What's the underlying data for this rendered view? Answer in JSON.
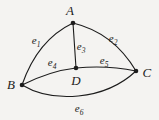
{
  "figure": {
    "background_color": "#f4f3f1",
    "ink_color": "#1c1c1c",
    "width": 159,
    "height": 120
  },
  "chart_data": {
    "type": "diagram",
    "subtype": "graph",
    "title": "",
    "vertices": [
      {
        "id": "A",
        "label": "A",
        "x": 73,
        "y": 23,
        "label_x": 70,
        "label_y": 10
      },
      {
        "id": "B",
        "label": "B",
        "x": 22,
        "y": 85,
        "label_x": 11,
        "label_y": 84
      },
      {
        "id": "C",
        "label": "C",
        "x": 136,
        "y": 71,
        "label_x": 147,
        "label_y": 72
      },
      {
        "id": "D",
        "label": "D",
        "x": 76,
        "y": 68,
        "label_x": 76,
        "label_y": 80
      }
    ],
    "edges": [
      {
        "id": "e1",
        "name": "e",
        "subscript": "1",
        "from": "A",
        "to": "B",
        "path": "M 73 23 C 52 33 33 53 22 85",
        "label_x": 36,
        "label_y": 40
      },
      {
        "id": "e2",
        "name": "e",
        "subscript": "2",
        "from": "A",
        "to": "C",
        "path": "M 73 23 C 98 29 120 44 136 71",
        "label_x": 113,
        "label_y": 38
      },
      {
        "id": "e3",
        "name": "e",
        "subscript": "3",
        "from": "A",
        "to": "D",
        "path": "M 73 23 L 76 68",
        "label_x": 81,
        "label_y": 46
      },
      {
        "id": "e4",
        "name": "e",
        "subscript": "4",
        "from": "B",
        "to": "D",
        "path": "M 22 85 C 40 76 58 70 76 68",
        "label_x": 52,
        "label_y": 62
      },
      {
        "id": "e5",
        "name": "e",
        "subscript": "5",
        "from": "D",
        "to": "C",
        "path": "M 76 68 C 96 66 117 67 136 71",
        "label_x": 104,
        "label_y": 60
      },
      {
        "id": "e6",
        "name": "e",
        "subscript": "6",
        "from": "B",
        "to": "C",
        "path": "M 22 85 C 52 103 104 101 136 71",
        "label_x": 79,
        "label_y": 108
      }
    ],
    "vertex_count": 4,
    "edge_count": 6,
    "legend": [],
    "annotations": []
  }
}
